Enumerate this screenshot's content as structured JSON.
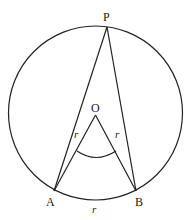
{
  "diagram": {
    "type": "geometry",
    "stroke_color": "#222222",
    "circle": {
      "cx": 95.5,
      "cy": 113,
      "r": 87
    },
    "points": {
      "P": {
        "label": "P",
        "x": 107,
        "y": 27
      },
      "O": {
        "label": "O",
        "x": 95.5,
        "y": 115
      },
      "A": {
        "label": "A",
        "x": 54,
        "y": 191
      },
      "B": {
        "label": "B",
        "x": 136,
        "y": 191
      }
    },
    "segments": [
      {
        "from": "P",
        "to": "A"
      },
      {
        "from": "P",
        "to": "B"
      },
      {
        "from": "O",
        "to": "A"
      },
      {
        "from": "O",
        "to": "B"
      }
    ],
    "labels": {
      "P": "P",
      "O": "O",
      "A": "A",
      "B": "B",
      "OA_length": "r",
      "OB_length": "r",
      "AB_arc_length": "r"
    }
  }
}
